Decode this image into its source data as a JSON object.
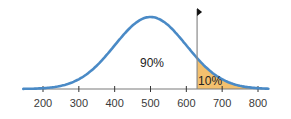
{
  "chart_data": {
    "type": "area",
    "title": "",
    "xlabel": "",
    "ylabel": "",
    "distribution": "normal",
    "mean": 500,
    "std_dev": 100,
    "xlim": [
      150,
      830
    ],
    "x_ticks": [
      200,
      300,
      400,
      500,
      600,
      700,
      800
    ],
    "tick_labels": [
      "200",
      "300",
      "400",
      "500",
      "600",
      "700",
      "800"
    ],
    "cutoff": 630,
    "shaded_region": {
      "from": 630,
      "to": 830,
      "label": "10%"
    },
    "unshaded_region": {
      "label": "90%"
    },
    "annotations": [
      {
        "text": "90%",
        "x": 500,
        "position": "center under curve"
      },
      {
        "text": "10%",
        "x": 660,
        "position": "in shaded right tail"
      },
      {
        "text": "flag marker",
        "x": 630,
        "position": "top of cutoff line"
      }
    ],
    "grid": false,
    "legend": null
  },
  "colors": {
    "curve": "#4a8ac6",
    "tail_fill": "#f3c06e",
    "axis": "#7a7a7a",
    "cutoff_line": "#8a8a8a",
    "flag": "#111111"
  },
  "labels": {
    "left_region": "90%",
    "right_region": "10%"
  }
}
